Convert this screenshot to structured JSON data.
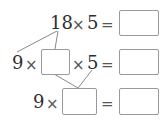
{
  "rows": [
    {
      "left_text": "18",
      "times1": "×",
      "factor": "5",
      "equals": "=",
      "answer_box": ""
    },
    {
      "left_text": "9",
      "times1": "×",
      "blank_box": "",
      "times2": "×",
      "factor": "5",
      "equals": "=",
      "answer_box": ""
    },
    {
      "left_text": "9",
      "times1": "×",
      "blank_box": "",
      "equals": "=",
      "answer_box": ""
    }
  ],
  "colors": {
    "text": "#2e2e2e",
    "box_border": "#9a9a9a",
    "line": "#7a7a7a"
  }
}
